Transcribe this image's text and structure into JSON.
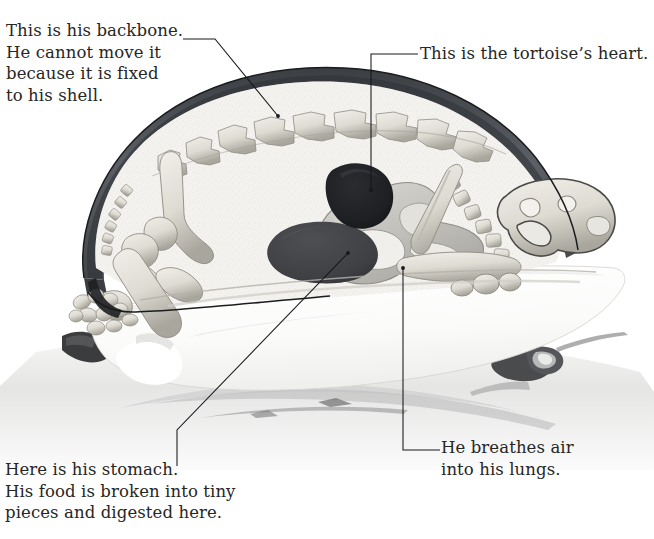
{
  "figure": {
    "background_color": "#ffffff",
    "text_color": "#262626",
    "leader_line_color": "#16181c"
  },
  "callouts": {
    "backbone": {
      "label": "This is his backbone.\nHe cannot move it\nbecause it is fixed\nto his shell.",
      "target": "backbone-vertebrae"
    },
    "heart": {
      "label": "This is the tortoise’s heart.",
      "target": "heart-organ"
    },
    "stomach": {
      "label": "Here is his stomach.\nHis food is broken into tiny\npieces and digested here.",
      "target": "stomach-organ"
    },
    "lungs": {
      "label": "He breathes air\ninto his lungs.",
      "target": "lung-organ"
    }
  },
  "artwork": {
    "parts": {
      "carapace_label": "carapace-shell",
      "carapace_color": "#585c61",
      "body_cavity_color": "#f2f1ee",
      "bone_color": "#dfddd6",
      "bone_shade_color": "#9d9a92",
      "heart_color": "#1f2023",
      "stomach_color": "#434548",
      "lung_color": "#c2c0ba",
      "plastron_color": "#fcfcfb",
      "ground_color": "#ededec",
      "outline_color": "#1b1c1e"
    }
  }
}
